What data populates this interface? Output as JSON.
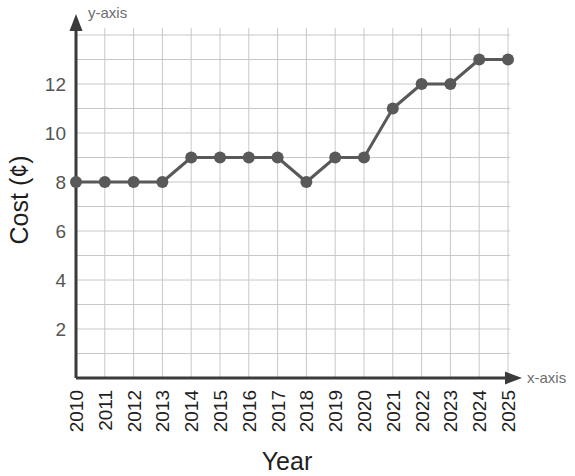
{
  "chart_data": {
    "type": "line",
    "title": "",
    "xlabel": "Year",
    "ylabel": "Cost (¢)",
    "x_axis_name": "x-axis",
    "y_axis_name": "y-axis",
    "categories": [
      "2010",
      "2011",
      "2012",
      "2013",
      "2014",
      "2015",
      "2016",
      "2017",
      "2018",
      "2019",
      "2020",
      "2021",
      "2022",
      "2023",
      "2024",
      "2025"
    ],
    "values": [
      8,
      8,
      8,
      8,
      9,
      9,
      9,
      9,
      8,
      9,
      9,
      11,
      12,
      12,
      13,
      13
    ],
    "series": [
      {
        "name": "Cost",
        "values": [
          8,
          8,
          8,
          8,
          9,
          9,
          9,
          9,
          8,
          9,
          9,
          11,
          12,
          12,
          13,
          13
        ]
      }
    ],
    "ytick_labels": [
      "2",
      "4",
      "6",
      "8",
      "10",
      "12"
    ],
    "ytick_values": [
      2,
      4,
      6,
      8,
      10,
      12
    ],
    "ylim": [
      0,
      13.8
    ],
    "xlim": [
      2010,
      2025
    ],
    "grid": true,
    "grid_step_y": 1,
    "grid_step_x": 1,
    "legend": "none",
    "xtick_rotation": "90",
    "colors": {
      "line": "#595959",
      "marker": "#595959",
      "grid": "#c8c8c8",
      "axis": "#3b3b3b",
      "tick_text": "#555555",
      "title_text": "#1f1f1f",
      "axis_name_text": "#6e6e6e",
      "background": "#ffffff"
    }
  }
}
